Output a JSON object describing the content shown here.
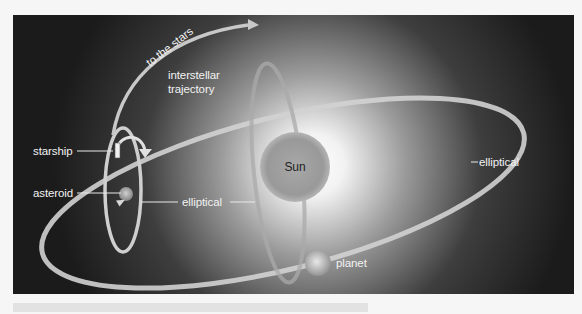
{
  "diagram": {
    "labels": {
      "to_the_stars": "to the stars",
      "interstellar_line1": "interstellar",
      "interstellar_line2": "trajectory",
      "starship": "starship",
      "asteroid": "asteroid",
      "elliptical_inner": "elliptical",
      "elliptical_outer": "elliptical",
      "sun": "Sun",
      "planet": "planet"
    },
    "colors": {
      "background": "#1b1b1b",
      "orbit": "#d8d8d8",
      "glow": "#ffffff",
      "sun": "#9a9a9a",
      "label": "#f2f2f2"
    }
  }
}
